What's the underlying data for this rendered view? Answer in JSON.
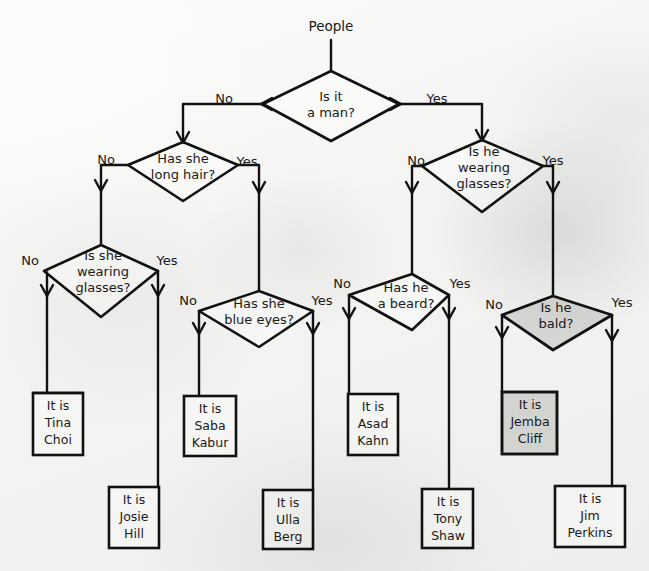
{
  "diagram": {
    "root": {
      "label": "People"
    },
    "colors": {
      "ink": "#111111",
      "paper": "#f4f4f2",
      "shade": "#96968e"
    },
    "edge_labels": {
      "yes": "Yes",
      "no": "No"
    },
    "decisions": [
      {
        "id": "is-it-a-man",
        "line1": "Is it",
        "line2": "a man?",
        "line3": ""
      },
      {
        "id": "has-she-long-hair",
        "line1": "Has she",
        "line2": "long hair?",
        "line3": ""
      },
      {
        "id": "is-he-wearing-glasses",
        "line1": "Is he",
        "line2": "wearing",
        "line3": "glasses?"
      },
      {
        "id": "is-she-wearing-glasses",
        "line1": "Is she",
        "line2": "wearing",
        "line3": "glasses?"
      },
      {
        "id": "has-she-blue-eyes",
        "line1": "Has she",
        "line2": "blue eyes?",
        "line3": ""
      },
      {
        "id": "has-he-a-beard",
        "line1": "Has he",
        "line2": "a beard?",
        "line3": ""
      },
      {
        "id": "is-he-bald",
        "line1": "Is he",
        "line2": "bald?",
        "line3": ""
      }
    ],
    "results": [
      {
        "id": "tina-choi",
        "line1": "It is",
        "line2": "Tina",
        "line3": "Choi"
      },
      {
        "id": "josie-hill",
        "line1": "It is",
        "line2": "Josie",
        "line3": "Hill"
      },
      {
        "id": "saba-kabur",
        "line1": "It is",
        "line2": "Saba",
        "line3": "Kabur"
      },
      {
        "id": "ulla-berg",
        "line1": "It is",
        "line2": "Ulla",
        "line3": "Berg"
      },
      {
        "id": "asad-kahn",
        "line1": "It is",
        "line2": "Asad",
        "line3": "Kahn"
      },
      {
        "id": "tony-shaw",
        "line1": "It is",
        "line2": "Tony",
        "line3": "Shaw"
      },
      {
        "id": "jemba-cliff",
        "line1": "It is",
        "line2": "Jemba",
        "line3": "Cliff"
      },
      {
        "id": "jim-perkins",
        "line1": "It is",
        "line2": "Jim",
        "line3": "Perkins"
      }
    ],
    "branch_labels": {
      "man_no": "No",
      "man_yes": "Yes",
      "longhair_no": "No",
      "longhair_yes": "Yes",
      "heglasses_no": "No",
      "heglasses_yes": "Yes",
      "sheglasses_no": "No",
      "sheglasses_yes": "Yes",
      "blueeyes_no": "No",
      "blueeyes_yes": "Yes",
      "beard_no": "No",
      "beard_yes": "Yes",
      "bald_no": "No",
      "bald_yes": "Yes"
    }
  }
}
